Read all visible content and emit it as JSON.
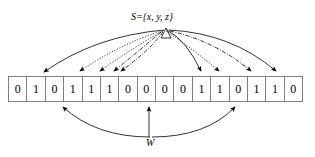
{
  "figure": {
    "type": "bloom-filter-diagram",
    "width": 315,
    "height": 157,
    "background_color": "#ffffff",
    "line_color": "#000000",
    "cell_border_color": "#808080"
  },
  "set_label": {
    "text": "S={x, y, z}",
    "x": 131,
    "y": 12
  },
  "w_label": {
    "text": "W",
    "x": 146,
    "y": 138
  },
  "bit_array": {
    "bits": [
      "0",
      "1",
      "0",
      "1",
      "1",
      "1",
      "0",
      "0",
      "0",
      "0",
      "1",
      "1",
      "0",
      "1",
      "1",
      "0"
    ],
    "cell_count": 16,
    "left": 8,
    "top": 76,
    "width": 295,
    "height": 26
  },
  "hash_source": {
    "x": 166,
    "y": 28
  },
  "hash_arrows": [
    {
      "element": "x",
      "style": "solid",
      "target_index": 1,
      "tip_x": 42,
      "tip_y": 74,
      "curve_x": 95,
      "curve_y": 36
    },
    {
      "element": "x",
      "style": "solid",
      "target_index": 10,
      "tip_x": 200,
      "tip_y": 74,
      "curve_x": 185,
      "curve_y": 40
    },
    {
      "element": "x",
      "style": "solid",
      "target_index": 14,
      "tip_x": 275,
      "tip_y": 74,
      "curve_x": 228,
      "curve_y": 34
    },
    {
      "element": "y",
      "style": "dotted",
      "target_index": 3,
      "tip_x": 78,
      "tip_y": 74,
      "curve_x": 120,
      "curve_y": 44
    },
    {
      "element": "y",
      "style": "dotted",
      "target_index": 5,
      "tip_x": 98,
      "tip_y": 74,
      "curve_x": 134,
      "curve_y": 46
    },
    {
      "element": "y",
      "style": "dotted",
      "target_index": 11,
      "tip_x": 218,
      "tip_y": 74,
      "curve_x": 193,
      "curve_y": 48
    },
    {
      "element": "z",
      "style": "dashdot",
      "target_index": 6,
      "tip_x": 112,
      "tip_y": 74,
      "curve_x": 142,
      "curve_y": 50
    },
    {
      "element": "z",
      "style": "dashdot",
      "target_index": 6,
      "tip_x": 119,
      "tip_y": 74,
      "curve_x": 148,
      "curve_y": 52
    },
    {
      "element": "z",
      "style": "dashdot",
      "target_index": 13,
      "tip_x": 250,
      "tip_y": 74,
      "curve_x": 212,
      "curve_y": 42
    }
  ],
  "w_arrows": [
    {
      "tip_x": 63,
      "tip_y": 104,
      "kind": "curve-left"
    },
    {
      "tip_x": 149,
      "tip_y": 104,
      "kind": "vertical"
    },
    {
      "tip_x": 234,
      "tip_y": 104,
      "kind": "curve-right"
    }
  ]
}
